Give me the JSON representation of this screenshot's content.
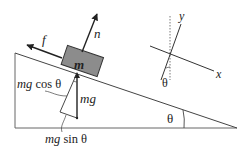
{
  "diagram": {
    "type": "inclined-plane-free-body",
    "labels": {
      "friction": "f",
      "normal": "n",
      "mass": "m",
      "weight": "mg",
      "weight_cos": "mg cos θ",
      "weight_cos_mg": "mg",
      "weight_cos_rest": " cos θ",
      "weight_sin_mg": "mg",
      "weight_sin_rest": " sin θ",
      "axis_x": "x",
      "axis_y": "y",
      "angle_axes": "θ",
      "angle_wedge": "θ",
      "angle_components": "θ"
    },
    "colors": {
      "line": "#333333",
      "block_fill": "#8a8a8a",
      "wedge_line": "#555555",
      "background": "#ffffff"
    }
  }
}
